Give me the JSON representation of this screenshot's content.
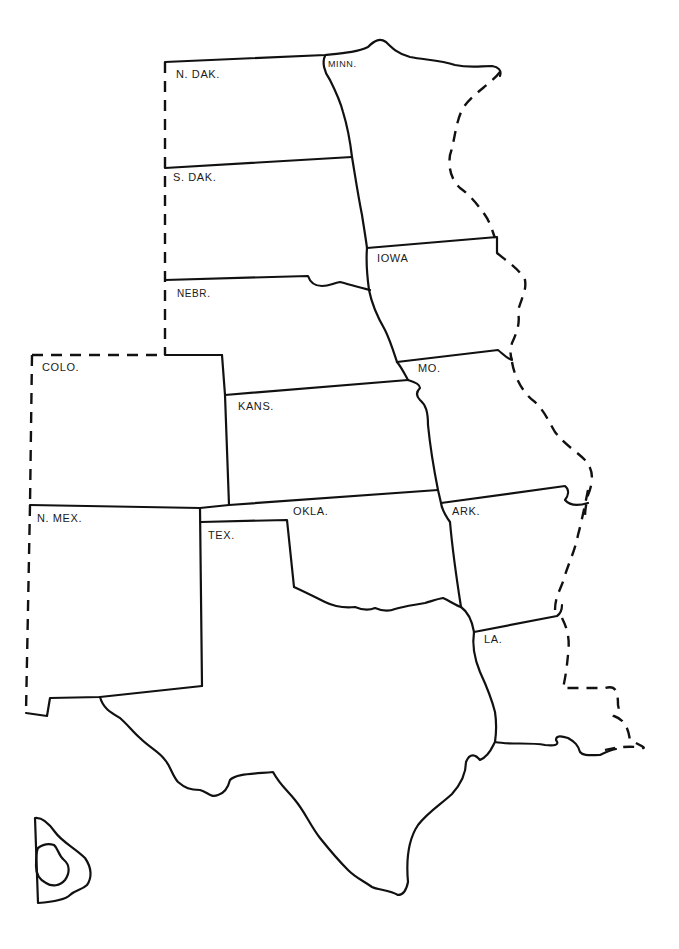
{
  "map": {
    "title": "",
    "style": {
      "line_color": "#111111",
      "background": "#ffffff"
    },
    "states": [
      {
        "id": "nd",
        "label": "N. DAK."
      },
      {
        "id": "mn",
        "label": "MINN."
      },
      {
        "id": "sd",
        "label": "S. DAK."
      },
      {
        "id": "ia",
        "label": "IOWA"
      },
      {
        "id": "ne",
        "label": "NEBR."
      },
      {
        "id": "co",
        "label": "COLO."
      },
      {
        "id": "mo",
        "label": "MO."
      },
      {
        "id": "ks",
        "label": "KANS."
      },
      {
        "id": "nm",
        "label": "N. MEX."
      },
      {
        "id": "ok",
        "label": "OKLA."
      },
      {
        "id": "ar",
        "label": "ARK."
      },
      {
        "id": "tx",
        "label": "TEX."
      },
      {
        "id": "la",
        "label": "LA."
      }
    ],
    "inset": {
      "label": ""
    }
  }
}
